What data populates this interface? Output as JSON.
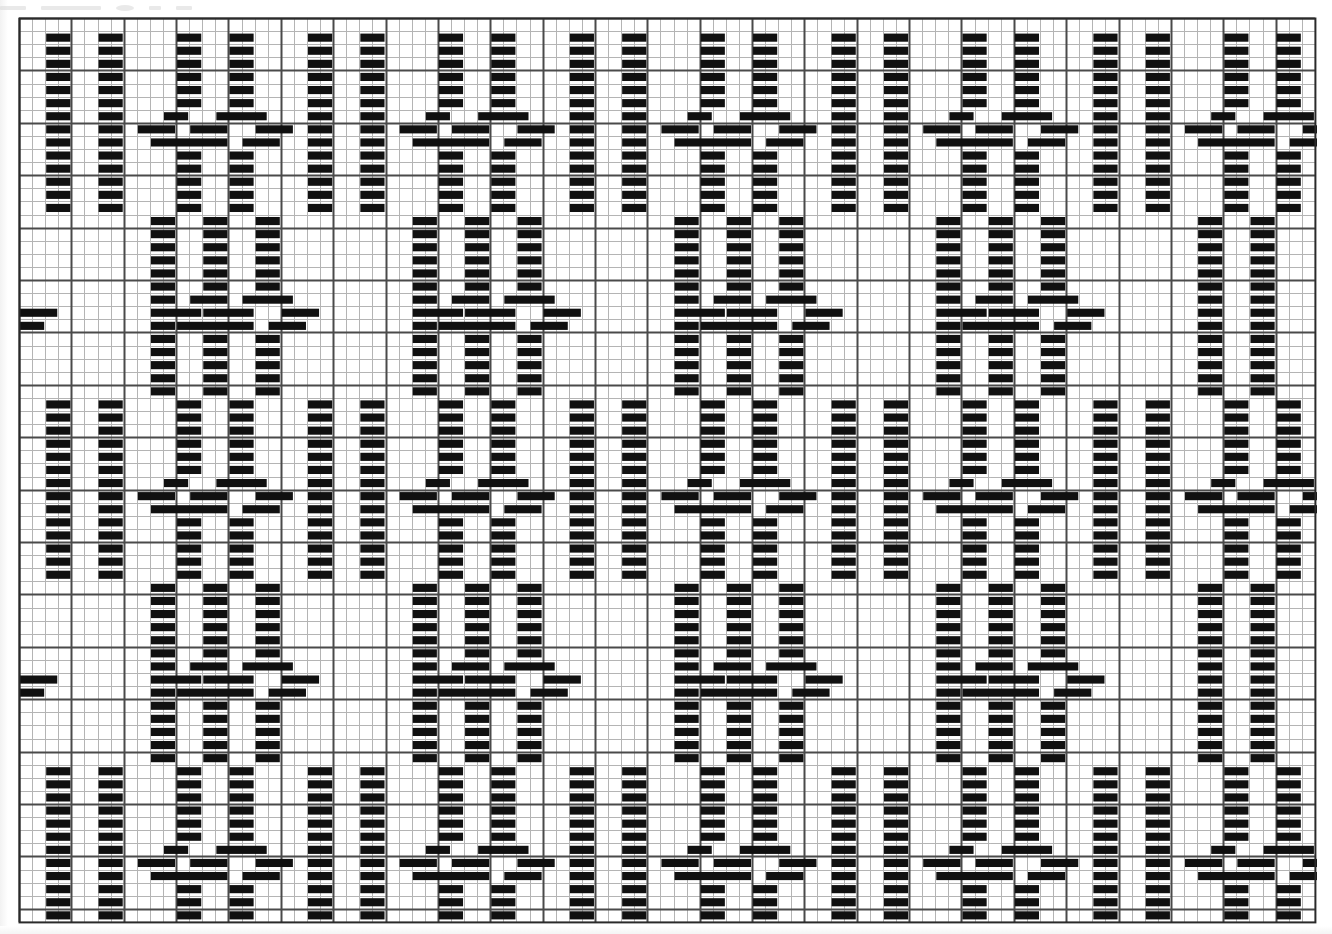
{
  "document": {
    "title": "Weaving Draft Pattern Grid",
    "type": "threading-draft",
    "header_artifact_text": "",
    "background_color": "#ffffff",
    "mark_color": "#101010",
    "grid_line_color": "#b4b4b4",
    "grid_major_line_color": "#4a4a4a",
    "border_color": "#2a2a2a"
  },
  "grid": {
    "origin_x": 17,
    "origin_y": 16,
    "cell_width": 13.09,
    "cell_height": 13.1,
    "columns": 99,
    "rows": 69,
    "minor_line_width": 1,
    "major_line_width": 2,
    "major_every_columns": 4,
    "major_every_rows": 4,
    "mark_width_cells": 2,
    "mark_height_cells": 0.62,
    "mark_inset_x": 1
  },
  "chart_data": {
    "type": "heatmap",
    "xlabel": "",
    "ylabel": "",
    "grid": true,
    "legend": "none",
    "columns": 99,
    "rows": 69,
    "pattern": {
      "band_count": 5,
      "band_height_rows": 14,
      "band_row_origins": [
        1,
        15,
        29,
        43,
        57
      ],
      "horizontal_repeat_cells": 20,
      "repeat_count": 5,
      "motif_names": [
        "pillar-pair",
        "bowtie-cross",
        "pillar-pair",
        "bowtie-cross"
      ],
      "description": "Two plain vertical pillar columns alternating with a pair of columns that break into a bowtie/X crossing at the band mid-height"
    },
    "motif_pillar": {
      "name": "pillar-pair",
      "column_offsets": [
        2,
        6
      ],
      "filled_rows": "all"
    },
    "motif_bowtie": {
      "name": "bowtie-cross",
      "column_offsets": [
        2,
        6
      ],
      "cross_rows_from_band_top": [
        6,
        7,
        8
      ],
      "left_limb_columns": [
        0,
        1,
        2,
        3,
        4
      ],
      "right_limb_columns": [
        4,
        5,
        6,
        7,
        8
      ]
    },
    "cells": [
      {
        "phase": "A",
        "note": "bands 1,3,5 start with pillar-pillar then bowtie"
      },
      {
        "phase": "B",
        "note": "bands 2,4 start with bowtie then pillar-pillar"
      }
    ]
  }
}
